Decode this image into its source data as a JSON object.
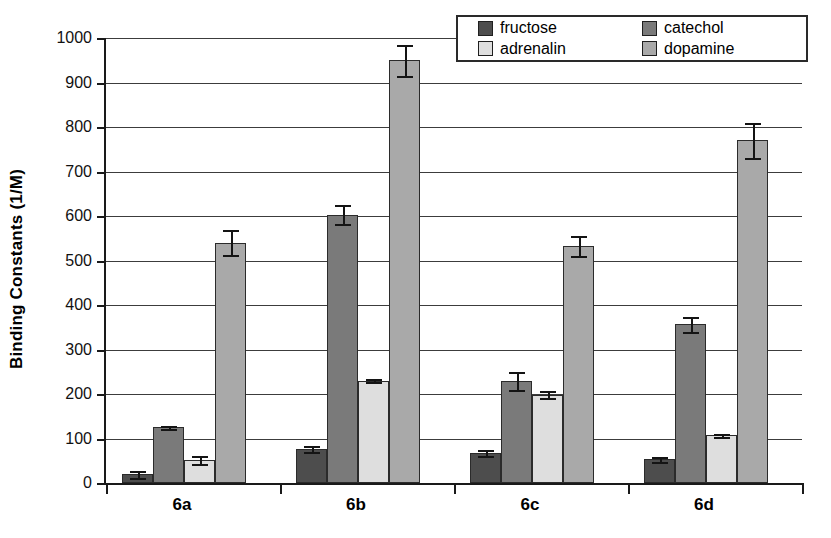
{
  "chart_data": {
    "type": "bar",
    "title": "",
    "xlabel": "",
    "ylabel": "Binding Constants (1/M)",
    "categories": [
      "6a",
      "6b",
      "6c",
      "6d"
    ],
    "ylim": [
      0,
      1000
    ],
    "ytick_step": 100,
    "yticks": [
      0,
      100,
      200,
      300,
      400,
      500,
      600,
      700,
      800,
      900,
      1000
    ],
    "ytick_labels": [
      "0",
      "100",
      "200",
      "300",
      "400",
      "500",
      "600",
      "700",
      "800",
      "900",
      "1000"
    ],
    "grid": true,
    "legend_position": "top-right",
    "error_bars": true,
    "series": [
      {
        "name": "fructose",
        "color": "#4d4d4d",
        "values": [
          20,
          77,
          67,
          53
        ],
        "errors": [
          8,
          7,
          7,
          6
        ]
      },
      {
        "name": "catechol",
        "color": "#7a7a7a",
        "values": [
          125,
          603,
          230,
          357
        ],
        "errors": [
          4,
          22,
          20,
          17
        ]
      },
      {
        "name": "adrenalin",
        "color": "#dedede",
        "values": [
          52,
          230,
          198,
          107
        ],
        "errors": [
          9,
          3,
          8,
          4
        ]
      },
      {
        "name": "dopamine",
        "color": "#a9a9a9",
        "values": [
          540,
          950,
          533,
          770
        ],
        "errors": [
          28,
          35,
          22,
          40
        ]
      }
    ]
  },
  "legend": {
    "entries": [
      {
        "label": "fructose",
        "swatch": "#4d4d4d"
      },
      {
        "label": "catechol",
        "swatch": "#7a7a7a"
      },
      {
        "label": "adrenalin",
        "swatch": "#dedede"
      },
      {
        "label": "dopamine",
        "swatch": "#a9a9a9"
      }
    ]
  },
  "axis": {
    "y_title": "Binding Constants (1/M)"
  }
}
